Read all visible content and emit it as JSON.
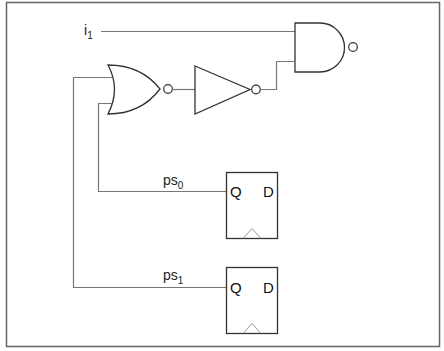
{
  "diagram": {
    "title": "",
    "colors": {
      "wire": "#777777",
      "gate": "#333333",
      "border": "#666666",
      "clock_triangle": "#999999",
      "background": "#ffffff"
    },
    "signals": {
      "i1": {
        "base": "i",
        "sub": "1"
      },
      "ps0": {
        "base": "ps",
        "sub": "0"
      },
      "ps1": {
        "base": "ps",
        "sub": "1"
      }
    },
    "gates": [
      {
        "id": "nor",
        "type": "NOR",
        "inputs": [
          "ps1",
          "ps0"
        ]
      },
      {
        "id": "not",
        "type": "NOT",
        "inputs": [
          "nor"
        ]
      },
      {
        "id": "nand",
        "type": "NAND",
        "inputs": [
          "i1",
          "not"
        ]
      }
    ],
    "flipflops": [
      {
        "id": "ff0",
        "output_label": "Q",
        "input_label": "D",
        "output_signal": "ps0"
      },
      {
        "id": "ff1",
        "output_label": "Q",
        "input_label": "D",
        "output_signal": "ps1"
      }
    ]
  }
}
